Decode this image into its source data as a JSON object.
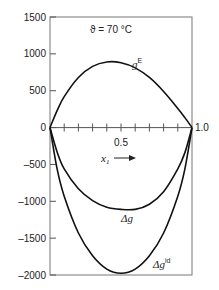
{
  "chart_data": {
    "type": "line",
    "title": "",
    "annotation": "ϑ = 70 °C",
    "xlabel": "x₁",
    "ylabel": "",
    "xlim": [
      0,
      1.0
    ],
    "ylim": [
      -2000,
      1500
    ],
    "yticks": [
      1500,
      1000,
      500,
      0,
      -500,
      -1000,
      -1500,
      -2000
    ],
    "ytick_labels": [
      "1500",
      "1000",
      "500",
      "0",
      "–500",
      "–1000",
      "–1500",
      "–2000"
    ],
    "xticks_minor": [
      0.1,
      0.2,
      0.3,
      0.4,
      0.5,
      0.6,
      0.7,
      0.8,
      0.9
    ],
    "xtick_labels": {
      "mid": "0.5",
      "end": "1.0"
    },
    "grid": false,
    "x": [
      0,
      0.05,
      0.1,
      0.2,
      0.3,
      0.4,
      0.5,
      0.6,
      0.7,
      0.8,
      0.9,
      0.95,
      1.0
    ],
    "series": [
      {
        "name": "gE",
        "label_main": "g",
        "label_sup": "E",
        "values": [
          0,
          230,
          420,
          680,
          830,
          890,
          880,
          810,
          680,
          490,
          260,
          135,
          0
        ]
      },
      {
        "name": "Δg",
        "label_main": "Δg",
        "label_sup": "",
        "values": [
          0,
          -330,
          -560,
          -830,
          -990,
          -1080,
          -1110,
          -1110,
          -1040,
          -870,
          -560,
          -340,
          0
        ]
      },
      {
        "name": "Δgid",
        "label_main": "Δg",
        "label_sup": "id",
        "values": [
          0,
          -560,
          -930,
          -1430,
          -1740,
          -1920,
          -1977,
          -1920,
          -1740,
          -1430,
          -930,
          -560,
          0
        ]
      }
    ]
  }
}
